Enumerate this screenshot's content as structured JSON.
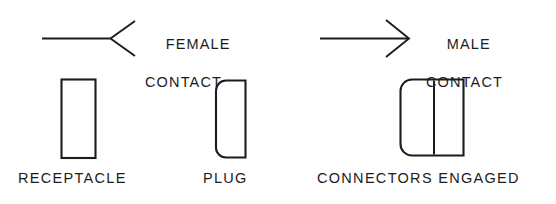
{
  "diagram": {
    "background_color": "#ffffff",
    "line_color": "#1c1c1c",
    "callouts": [
      {
        "id": "female-contact",
        "symbol": "female-contact-symbol",
        "line_1": "FEMALE",
        "line_2": "CONTACT"
      },
      {
        "id": "male-contact",
        "symbol": "male-contact-symbol",
        "line_1": "MALE",
        "line_2": "CONTACT"
      }
    ],
    "parts": [
      {
        "id": "receptacle",
        "label": "RECEPTACLE",
        "shape": "square-cornered-rectangle"
      },
      {
        "id": "plug",
        "label": "PLUG",
        "shape": "left-rounded-rectangle"
      },
      {
        "id": "connectors-engaged",
        "label": "CONNECTORS ENGAGED",
        "shape": "left-rounded-rectangle-with-divider"
      }
    ]
  }
}
